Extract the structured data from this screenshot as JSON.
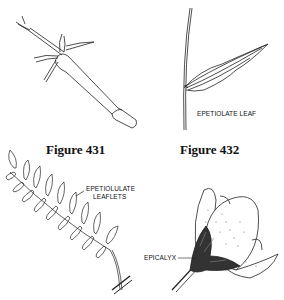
{
  "figures": [
    {
      "id": "431",
      "caption": "Figure 431",
      "subject": "tubular-flower-with-calyx-lobes",
      "labels": []
    },
    {
      "id": "432",
      "caption": "Figure 432",
      "subject": "epetiolate-leaf-on-stem",
      "labels": [
        "EPETIOLATE LEAF"
      ]
    },
    {
      "id": "433",
      "caption": "",
      "subject": "pinnate-leaf-with-leaflets",
      "labels": [
        "EPETIOLULATE",
        "LEAFLETS"
      ]
    },
    {
      "id": "434",
      "caption": "",
      "subject": "flower-bud-with-epicalyx",
      "labels": [
        "EPICALYX"
      ]
    }
  ]
}
